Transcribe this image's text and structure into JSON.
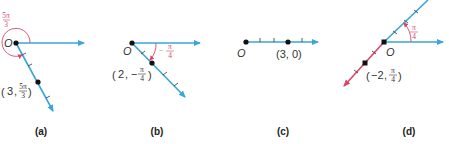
{
  "colors": {
    "ray": "#3aa6d8",
    "negative_ray": "#d9466a",
    "angle_arc": "#d9466a",
    "point": "#111111",
    "text": "#333333"
  },
  "panels": [
    {
      "caption": "(a)",
      "pole_label": "O",
      "point_label": "(3, 5π/3)",
      "point_r": "3",
      "point_theta_num": "5π",
      "point_theta_den": "3",
      "angle_num": "5π",
      "angle_den": "3"
    },
    {
      "caption": "(b)",
      "pole_label": "O",
      "point_label": "(2, −π/4)",
      "point_r": "2",
      "point_theta_num": "π",
      "point_theta_den": "4",
      "angle_sign": "−",
      "angle_num": "π",
      "angle_den": "4"
    },
    {
      "caption": "(c)",
      "pole_label": "O",
      "point_label": "(3, 0)"
    },
    {
      "caption": "(d)",
      "pole_label": "O",
      "point_label": "(−2, π/4)",
      "point_r": "−2",
      "point_theta_num": "π",
      "point_theta_den": "4",
      "angle_num": "π",
      "angle_den": "4"
    }
  ]
}
